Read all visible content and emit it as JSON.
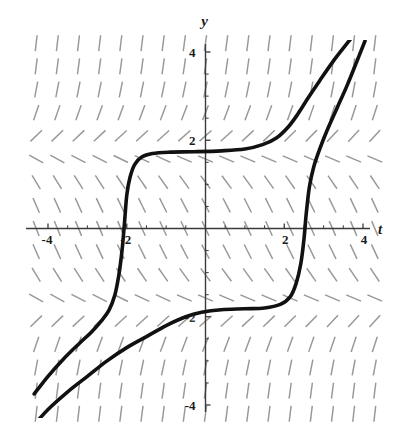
{
  "chart_data": {
    "type": "line",
    "title": "",
    "subtitle": "",
    "xlabel": "t",
    "ylabel": "y",
    "xlim": [
      -4.6,
      4.6
    ],
    "ylim": [
      -4.6,
      4.6
    ],
    "grid": false,
    "legend": null,
    "x_ticks": [
      -4,
      -2,
      2,
      4
    ],
    "x_tick_labels": [
      "-4",
      "-2",
      "2",
      "4"
    ],
    "y_ticks": [
      -4,
      2,
      4
    ],
    "y_tick_labels": [
      "-4",
      "2",
      "4"
    ],
    "y_tick_hidden_labels": [
      "-2"
    ],
    "axis_color": "#3a3a3a",
    "curve_color": "#111111",
    "field_color": "#8a8a8a",
    "background": "#ffffff",
    "field": {
      "style": "dashes",
      "x_range": [
        -4.3,
        4.3
      ],
      "y_range": [
        -4.2,
        4.2
      ],
      "x_count": 17,
      "y_count": 17,
      "slope_rule": "dy/dt = 0.62*(y*y - 3.1) scaled, near-zero near y = +/-1.76"
    },
    "series": [
      {
        "name": "upper-solution-curve",
        "plateau_y": 1.72,
        "inflection_t": -2.05,
        "points": [
          [
            -4.35,
            -3.75
          ],
          [
            -4.0,
            -3.35
          ],
          [
            -3.6,
            -2.95
          ],
          [
            -3.2,
            -2.6
          ],
          [
            -2.9,
            -2.35
          ],
          [
            -2.65,
            -2.1
          ],
          [
            -2.45,
            -1.85
          ],
          [
            -2.3,
            -1.5
          ],
          [
            -2.2,
            -1.05
          ],
          [
            -2.12,
            -0.5
          ],
          [
            -2.06,
            0.1
          ],
          [
            -2.0,
            0.75
          ],
          [
            -1.92,
            1.15
          ],
          [
            -1.8,
            1.45
          ],
          [
            -1.62,
            1.62
          ],
          [
            -1.35,
            1.7
          ],
          [
            -0.9,
            1.73
          ],
          [
            -0.3,
            1.74
          ],
          [
            0.4,
            1.76
          ],
          [
            1.0,
            1.8
          ],
          [
            1.45,
            1.9
          ],
          [
            1.8,
            2.05
          ],
          [
            2.1,
            2.3
          ],
          [
            2.35,
            2.6
          ],
          [
            2.6,
            2.95
          ],
          [
            2.9,
            3.35
          ],
          [
            3.25,
            3.8
          ],
          [
            3.6,
            4.2
          ],
          [
            3.78,
            4.4
          ]
        ]
      },
      {
        "name": "lower-solution-curve",
        "plateau_y": -1.82,
        "inflection_t": 2.4,
        "points": [
          [
            -4.35,
            -4.45
          ],
          [
            -4.0,
            -4.1
          ],
          [
            -3.5,
            -3.7
          ],
          [
            -3.0,
            -3.35
          ],
          [
            -2.5,
            -3.0
          ],
          [
            -2.0,
            -2.7
          ],
          [
            -1.5,
            -2.45
          ],
          [
            -1.0,
            -2.2
          ],
          [
            -0.5,
            -2.0
          ],
          [
            -0.1,
            -1.9
          ],
          [
            0.4,
            -1.84
          ],
          [
            1.0,
            -1.82
          ],
          [
            1.5,
            -1.8
          ],
          [
            1.9,
            -1.72
          ],
          [
            2.15,
            -1.55
          ],
          [
            2.3,
            -1.25
          ],
          [
            2.42,
            -0.8
          ],
          [
            2.5,
            -0.25
          ],
          [
            2.56,
            0.35
          ],
          [
            2.64,
            0.95
          ],
          [
            2.75,
            1.4
          ],
          [
            2.9,
            1.8
          ],
          [
            3.1,
            2.25
          ],
          [
            3.35,
            2.75
          ],
          [
            3.6,
            3.25
          ],
          [
            3.85,
            3.8
          ],
          [
            4.05,
            4.25
          ]
        ]
      }
    ]
  }
}
